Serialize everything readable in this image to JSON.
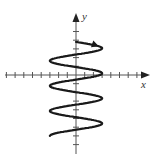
{
  "chart_data": {
    "type": "line",
    "title": "",
    "xlabel": "x",
    "ylabel": "y",
    "grid": false,
    "legend": null,
    "x_ticks_count_each_side": 8,
    "y_ticks_count_above": 7,
    "y_ticks_count_below": 9,
    "xlim": [
      -8,
      8
    ],
    "ylim": [
      -9,
      7
    ],
    "curve": {
      "amplitude": 3,
      "start": [
        0,
        4
      ],
      "end": [
        -1,
        -7
      ],
      "right_peaks_y": [
        2.4,
        -0.8,
        -3.2,
        -5.6
      ],
      "left_peaks_y": [
        0.6,
        -2.2,
        -4.4,
        -6.7
      ],
      "direction": "start at top, arrow pointing right"
    }
  },
  "axes": {
    "x_label": "x",
    "y_label": "y"
  }
}
